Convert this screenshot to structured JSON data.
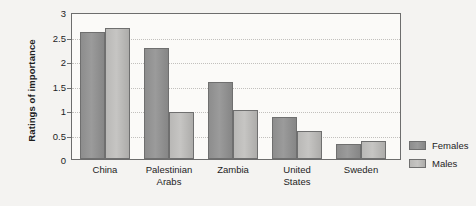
{
  "chart_data": {
    "type": "bar",
    "title": "",
    "xlabel": "",
    "ylabel": "Ratings of importance",
    "ylim": [
      0,
      3
    ],
    "yticks": [
      "0",
      "0.5",
      "1",
      "1.5",
      "2",
      "2.5",
      "3"
    ],
    "ytick_values": [
      0,
      0.5,
      1,
      1.5,
      2,
      2.5,
      3
    ],
    "grid": "horizontal-dotted",
    "legend_position": "right",
    "categories": [
      "China",
      "Palestinian Arabs",
      "Zambia",
      "United States",
      "Sweden"
    ],
    "category_lines": [
      [
        "China"
      ],
      [
        "Palestinian",
        "Arabs"
      ],
      [
        "Zambia"
      ],
      [
        "United",
        "States"
      ],
      [
        "Sweden"
      ]
    ],
    "series": [
      {
        "name": "Females",
        "color": "#8d8d8d",
        "values": [
          2.6,
          2.27,
          1.57,
          0.86,
          0.3
        ]
      },
      {
        "name": "Males",
        "color": "#c0bfbd",
        "values": [
          2.67,
          0.96,
          1.0,
          0.57,
          0.37
        ]
      }
    ]
  },
  "legend": {
    "items": [
      {
        "label": "Females"
      },
      {
        "label": "Males"
      }
    ]
  }
}
